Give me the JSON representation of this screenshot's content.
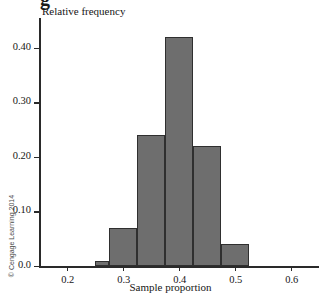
{
  "figure": {
    "caption_clip_text": "g",
    "copyright": "© Cengage Learning 2014"
  },
  "chart_data": {
    "type": "bar",
    "title": "",
    "subtitle": "",
    "xlabel": "Sample proportion",
    "ylabel": "Relative frequency",
    "grid": false,
    "legend": "none",
    "xlim": [
      0.15,
      0.65
    ],
    "ylim": [
      0.0,
      0.455
    ],
    "bin_width": 0.025,
    "xticks": [
      0.2,
      0.3,
      0.4,
      0.5,
      0.6
    ],
    "xtick_labels": [
      "0.2",
      "0.3",
      "0.4",
      "0.5",
      "0.6"
    ],
    "yticks": [
      0.0,
      0.1,
      0.2,
      0.3,
      0.4
    ],
    "ytick_labels": [
      "0.0",
      "0.10",
      "0.20",
      "0.30",
      "0.40"
    ],
    "bins": [
      {
        "left": 0.25,
        "right": 0.275,
        "value": 0.01
      },
      {
        "left": 0.275,
        "right": 0.325,
        "value": 0.07
      },
      {
        "left": 0.325,
        "right": 0.375,
        "value": 0.24
      },
      {
        "left": 0.375,
        "right": 0.425,
        "value": 0.42
      },
      {
        "left": 0.425,
        "right": 0.475,
        "value": 0.22
      },
      {
        "left": 0.475,
        "right": 0.525,
        "value": 0.04
      }
    ],
    "categories": [
      "0.250-0.275",
      "0.275-0.325",
      "0.325-0.375",
      "0.375-0.425",
      "0.425-0.475",
      "0.475-0.525"
    ],
    "values": [
      0.01,
      0.07,
      0.24,
      0.42,
      0.22,
      0.04
    ],
    "colors": {
      "bar_fill": "#6e6e6e",
      "bar_stroke": "#2f2f2f",
      "axis": "#2a2a2a",
      "text": "#161616",
      "background": "#ffffff"
    }
  }
}
